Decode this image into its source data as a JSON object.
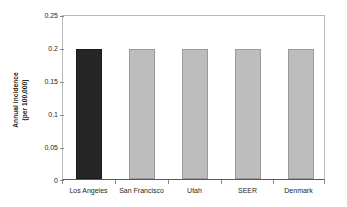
{
  "chart_data": {
    "type": "bar",
    "title": "",
    "xlabel": "",
    "ylabel": "Annual incidence (per 100,000)",
    "ylabel_lines": [
      "Annual incidence",
      "(per 100,000)"
    ],
    "categories": [
      "Los Angeles",
      "San Francisco",
      "Utah",
      "SEER",
      "Denmark"
    ],
    "values": [
      0.2,
      0.2,
      0.2,
      0.2,
      0.2
    ],
    "ylim": [
      0,
      0.25
    ],
    "yticks": [
      0,
      0.05,
      0.1,
      0.15,
      0.2,
      0.25
    ],
    "ytick_labels": [
      "0",
      "0.05",
      "0.1",
      "0.15",
      "0.2",
      "0.25"
    ],
    "grid": false,
    "legend": "none",
    "bar_colors": [
      "#262626",
      "#bdbdbd",
      "#bdbdbd",
      "#bdbdbd",
      "#bdbdbd"
    ],
    "highlight_category": "Los Angeles",
    "colors": {
      "highlight": "#262626",
      "default_bar": "#bdbdbd",
      "bar_border": "#9a9a9a",
      "axis": "#58585a",
      "frame": "#b9b9b9",
      "text": "#231f20",
      "background": "#ffffff"
    }
  }
}
